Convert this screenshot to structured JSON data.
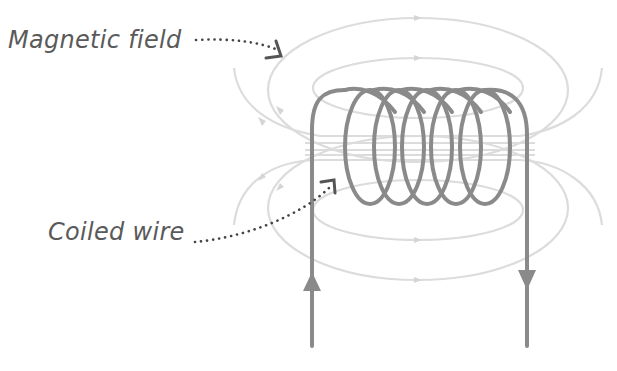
{
  "labels": {
    "magnetic_field": "Magnetic field",
    "coiled_wire": "Coiled wire"
  },
  "colors": {
    "wire": "#8a8a8a",
    "field_lines": "#d9d9d9",
    "label_text": "#5a5a5a",
    "pointer": "#555555",
    "background": "#ffffff"
  },
  "diagram": {
    "coil_turns": 6,
    "current_direction": {
      "left_lead": "up",
      "right_lead": "down"
    },
    "field_line_icons": [
      "arrow-right-icon",
      "arrow-left-icon"
    ]
  }
}
